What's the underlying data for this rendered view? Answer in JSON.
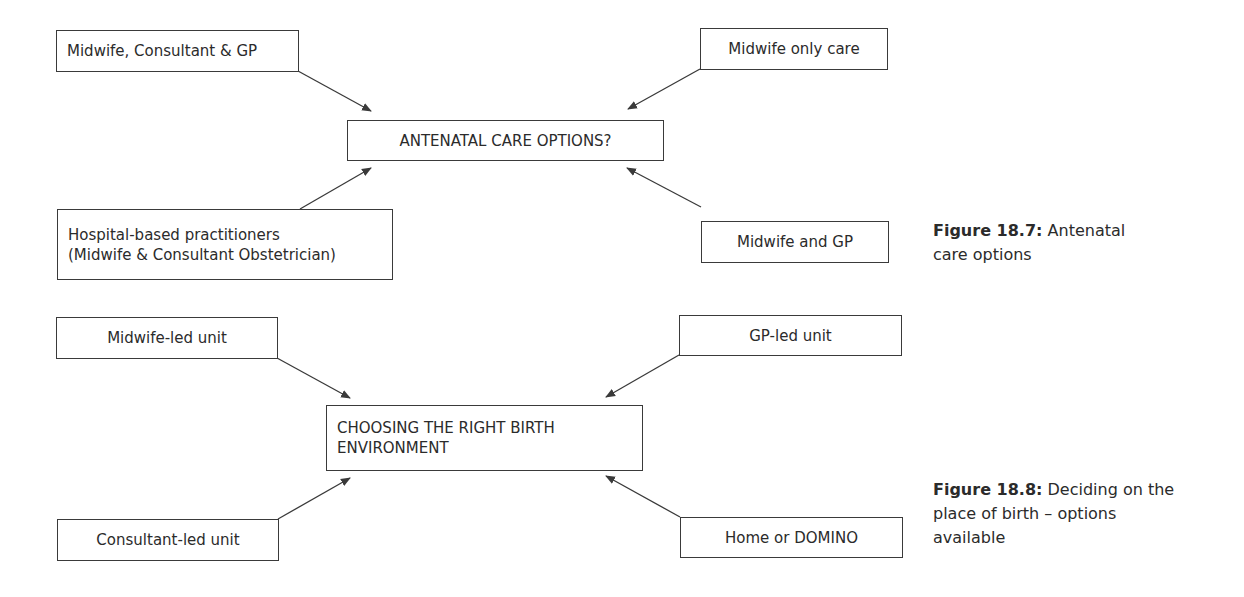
{
  "figure_18_7": {
    "center": "ANTENATAL CARE OPTIONS?",
    "options": [
      "Midwife, Consultant & GP",
      "Midwife only care",
      "Hospital-based practitioners",
      "(Midwife & Consultant Obstetrician)",
      "Midwife and GP"
    ],
    "caption_label": "Figure 18.7:",
    "caption_text": "Antenatal care options"
  },
  "figure_18_8": {
    "center_line1": "CHOOSING THE RIGHT BIRTH",
    "center_line2": "ENVIRONMENT",
    "options": [
      "Midwife-led unit",
      "GP-led unit",
      "Consultant-led unit",
      "Home or DOMINO"
    ],
    "caption_label": "Figure 18.8:",
    "caption_text": "Deciding on the place of birth – options available"
  },
  "colors": {
    "line": "#3a3a3a",
    "text": "#2b2b2b",
    "background": "#ffffff"
  }
}
